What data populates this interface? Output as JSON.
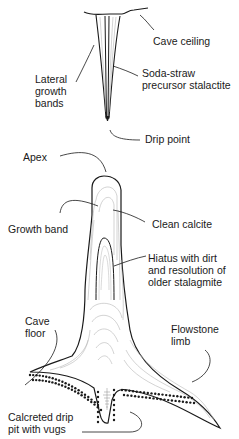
{
  "diagram": {
    "stalactite": {
      "labels": {
        "cave_ceiling": "Cave ceiling",
        "lateral_growth_bands": "Lateral\ngrowth\nbands",
        "soda_straw": "Soda-straw\nprecursor stalactite",
        "drip_point": "Drip point"
      }
    },
    "stalagmite": {
      "labels": {
        "apex": "Apex",
        "growth_band": "Growth band",
        "clean_calcite": "Clean calcite",
        "hiatus": "Hiatus with dirt\nand resolution of\nolder stalagmite",
        "cave_floor": "Cave\nfloor",
        "flowstone_limb": "Flowstone\nlimb",
        "calcreted_drip_pit": "Calcreted drip\npit with vugs"
      }
    },
    "colors": {
      "outline": "#1a1a1a",
      "growth_lines": "#b5b5b5",
      "text": "#1a1a1a"
    }
  }
}
